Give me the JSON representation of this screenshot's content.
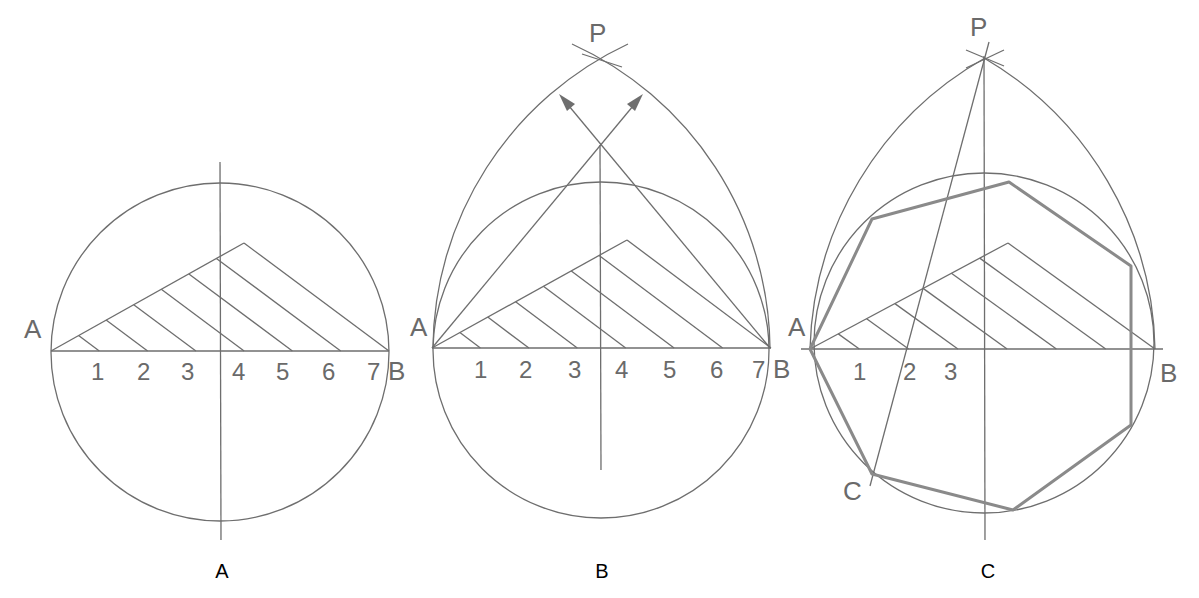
{
  "figure": {
    "line_color": "#6e6e6e",
    "polygon_color": "#8a8a8a",
    "caption_color": "#000000",
    "panels": [
      {
        "id": "A",
        "caption": "A",
        "endpoint_labels": {
          "start": "A",
          "end": "B"
        },
        "division_labels": [
          "1",
          "2",
          "3",
          "4",
          "5",
          "6",
          "7"
        ],
        "divisions": 7
      },
      {
        "id": "B",
        "caption": "B",
        "endpoint_labels": {
          "start": "A",
          "end": "B"
        },
        "apex_label": "P",
        "division_labels": [
          "1",
          "2",
          "3",
          "4",
          "5",
          "6",
          "7"
        ],
        "divisions": 7
      },
      {
        "id": "C",
        "caption": "C",
        "endpoint_labels": {
          "start": "A",
          "end": "B"
        },
        "apex_label": "P",
        "vertex_label": "C",
        "division_labels": [
          "1",
          "2",
          "3"
        ],
        "divisions": 7,
        "polygon_sides": 7
      }
    ]
  }
}
